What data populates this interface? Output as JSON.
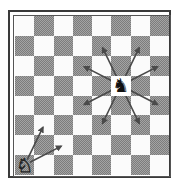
{
  "diagram": {
    "files": [
      "a",
      "b",
      "c",
      "d",
      "e",
      "f",
      "g",
      "h"
    ],
    "ranks": [
      8,
      7,
      6,
      5,
      4,
      3,
      2,
      1
    ],
    "colors": {
      "light_square": "#fbfbfb",
      "dark_square": "#9a9a9a",
      "arrow": "#4a4a4a",
      "frame": "#3a3a3a"
    },
    "pieces": [
      {
        "name": "black-knight",
        "color": "black",
        "type": "knight",
        "square": "f5",
        "glyph": "♞"
      },
      {
        "name": "white-knight",
        "color": "white",
        "type": "knight",
        "square": "a1",
        "glyph": "♘"
      }
    ],
    "arrows": [
      {
        "from": "f5",
        "to": "e7"
      },
      {
        "from": "f5",
        "to": "g7"
      },
      {
        "from": "f5",
        "to": "d6"
      },
      {
        "from": "f5",
        "to": "h6"
      },
      {
        "from": "f5",
        "to": "d4"
      },
      {
        "from": "f5",
        "to": "h4"
      },
      {
        "from": "f5",
        "to": "e3"
      },
      {
        "from": "f5",
        "to": "g3"
      },
      {
        "from": "a1",
        "to": "b3"
      },
      {
        "from": "a1",
        "to": "c2"
      }
    ]
  }
}
